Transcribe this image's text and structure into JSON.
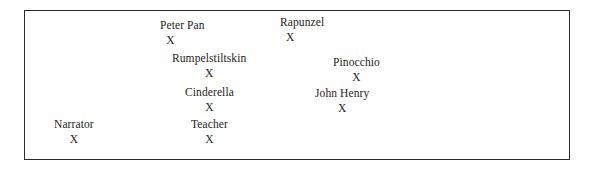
{
  "diagram": {
    "type": "character-position-map",
    "frame": {
      "border_color": "#2b2b2b",
      "background_color": "#ffffff"
    },
    "marker_glyph": "X",
    "entries": [
      {
        "id": "peter-pan",
        "name": "Peter Pan",
        "marker": "X",
        "x": 160,
        "y": 20,
        "marker_align": "offset-left"
      },
      {
        "id": "rapunzel",
        "name": "Rapunzel",
        "marker": "X",
        "x": 280,
        "y": 17,
        "marker_align": "offset-left"
      },
      {
        "id": "rumpelstiltskin",
        "name": "Rumpelstiltskin",
        "marker": "X",
        "x": 172,
        "y": 53,
        "marker_align": "center"
      },
      {
        "id": "pinocchio",
        "name": "Pinocchio",
        "marker": "X",
        "x": 333,
        "y": 57,
        "marker_align": "center"
      },
      {
        "id": "cinderella",
        "name": "Cinderella",
        "marker": "X",
        "x": 185,
        "y": 87,
        "marker_align": "center"
      },
      {
        "id": "john-henry",
        "name": "John Henry",
        "marker": "X",
        "x": 315,
        "y": 88,
        "marker_align": "center"
      },
      {
        "id": "narrator",
        "name": "Narrator",
        "marker": "X",
        "x": 54,
        "y": 119,
        "marker_align": "center"
      },
      {
        "id": "teacher",
        "name": "Teacher",
        "marker": "X",
        "x": 191,
        "y": 119,
        "marker_align": "center"
      }
    ]
  }
}
